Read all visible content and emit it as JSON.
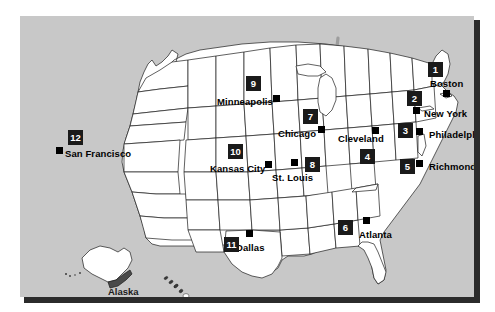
{
  "figure": {
    "background_color": "#ffffff",
    "panel_color": "#c8c8c8",
    "land_color": "#ffffff",
    "border_color": "#1a1a1a",
    "highway_color": "#9a9a9a",
    "badge_bg": "#1a1a1a",
    "badge_text_color": "#ffffff",
    "marker_color": "#000000",
    "shadow_color": "#2b2b2b"
  },
  "map": {
    "cities": [
      {
        "rank": "1",
        "name": "Boston",
        "label_x": 410,
        "label_y": 63,
        "marker_x": 423,
        "marker_y": 74,
        "badge_x": 408,
        "badge_y": 46
      },
      {
        "rank": "2",
        "name": "New York",
        "label_x": 404,
        "label_y": 93,
        "marker_x": 393,
        "marker_y": 91,
        "badge_x": 387,
        "badge_y": 75
      },
      {
        "rank": "3",
        "name": "Philadelphia",
        "label_x": 409,
        "label_y": 114,
        "marker_x": 396,
        "marker_y": 112,
        "badge_x": 378,
        "badge_y": 107
      },
      {
        "rank": "4",
        "name": "Cleveland",
        "label_x": 318,
        "label_y": 118,
        "marker_x": 352,
        "marker_y": 111,
        "badge_x": 340,
        "badge_y": 133
      },
      {
        "rank": "5",
        "name": "Richmond",
        "label_x": 409,
        "label_y": 146,
        "marker_x": 396,
        "marker_y": 144,
        "badge_x": 380,
        "badge_y": 143
      },
      {
        "rank": "6",
        "name": "Atlanta",
        "label_x": 339,
        "label_y": 214,
        "marker_x": 343,
        "marker_y": 201,
        "badge_x": 318,
        "badge_y": 204
      },
      {
        "rank": "7",
        "name": "Chicago",
        "label_x": 258,
        "label_y": 113,
        "marker_x": 298,
        "marker_y": 110,
        "badge_x": 283,
        "badge_y": 93
      },
      {
        "rank": "8",
        "name": "St. Louis",
        "label_x": 252,
        "label_y": 157,
        "marker_x": 271,
        "marker_y": 143,
        "badge_x": 285,
        "badge_y": 141
      },
      {
        "rank": "9",
        "name": "Minneapolis",
        "label_x": 197,
        "label_y": 81,
        "marker_x": 253,
        "marker_y": 79,
        "badge_x": 226,
        "badge_y": 60
      },
      {
        "rank": "10",
        "name": "Kansas City",
        "label_x": 190,
        "label_y": 148,
        "marker_x": 245,
        "marker_y": 145,
        "badge_x": 208,
        "badge_y": 128
      },
      {
        "rank": "11",
        "name": "Dallas",
        "label_x": 216,
        "label_y": 227,
        "marker_x": 226,
        "marker_y": 214,
        "badge_x": 204,
        "badge_y": 221
      },
      {
        "rank": "12",
        "name": "San Francisco",
        "label_x": 45,
        "label_y": 133,
        "marker_x": 36,
        "marker_y": 131,
        "badge_x": 48,
        "badge_y": 114
      }
    ],
    "insets": [
      {
        "name": "Alaska",
        "label_x": 88,
        "label_y": 271
      },
      {
        "name": "Hawaii",
        "label_x": 133,
        "label_y": 288
      }
    ]
  }
}
